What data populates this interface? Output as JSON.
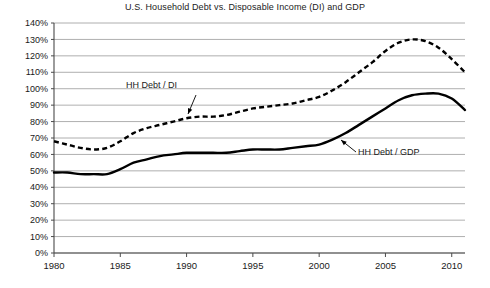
{
  "chart_data": {
    "type": "line",
    "title": "U.S. Household Debt vs. Disposable Income (DI) and GDP",
    "xlabel": "",
    "ylabel": "",
    "xlim": [
      1980,
      2011
    ],
    "ylim": [
      0,
      140
    ],
    "grid": true,
    "legend_position": "inline-annotations",
    "x_ticks": [
      "1980",
      "1985",
      "1990",
      "1995",
      "2000",
      "2005",
      "2010"
    ],
    "x_tick_values": [
      1980,
      1985,
      1990,
      1995,
      2000,
      2005,
      2010
    ],
    "y_ticks": [
      "0%",
      "10%",
      "20%",
      "30%",
      "40%",
      "50%",
      "60%",
      "70%",
      "80%",
      "90%",
      "100%",
      "110%",
      "120%",
      "130%",
      "140%"
    ],
    "y_tick_values": [
      0,
      10,
      20,
      30,
      40,
      50,
      60,
      70,
      80,
      90,
      100,
      110,
      120,
      130,
      140
    ],
    "x": [
      1980,
      1981,
      1982,
      1983,
      1984,
      1985,
      1986,
      1987,
      1988,
      1989,
      1990,
      1991,
      1992,
      1993,
      1994,
      1995,
      1996,
      1997,
      1998,
      1999,
      2000,
      2001,
      2002,
      2003,
      2004,
      2005,
      2006,
      2007,
      2008,
      2009,
      2010,
      2011
    ],
    "series": [
      {
        "name": "HH Debt / DI",
        "style": "dashed",
        "color": "#000000",
        "annotation": "HH Debt / DI",
        "values": [
          68,
          66,
          64,
          63,
          64,
          68,
          73,
          76,
          78,
          80,
          82,
          83,
          83,
          84,
          86,
          88,
          89,
          90,
          91,
          93,
          95,
          99,
          104,
          110,
          116,
          123,
          128,
          130,
          129,
          125,
          118,
          110
        ]
      },
      {
        "name": "HH Debt / GDP",
        "style": "solid",
        "color": "#000000",
        "annotation": "HH Debt / GDP",
        "values": [
          49,
          49,
          48,
          48,
          48,
          51,
          55,
          57,
          59,
          60,
          61,
          61,
          61,
          61,
          62,
          63,
          63,
          63,
          64,
          65,
          66,
          69,
          73,
          78,
          83,
          88,
          93,
          96,
          97,
          97,
          94,
          87
        ]
      }
    ],
    "annotations": [
      {
        "text": "HH Debt / DI",
        "target_series": "HH Debt / DI",
        "target_x": 1990,
        "target_y": 82
      },
      {
        "text": "HH Debt / GDP",
        "target_series": "HH Debt / GDP",
        "target_x": 2001.5,
        "target_y": 70
      }
    ]
  }
}
